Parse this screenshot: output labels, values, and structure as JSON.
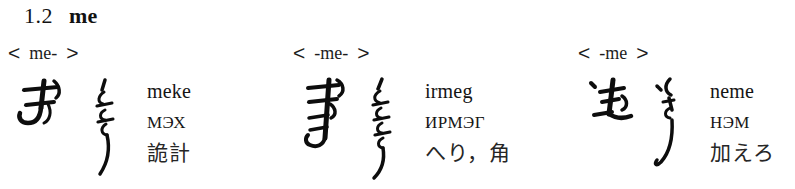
{
  "section": {
    "number": "1.2",
    "lemma": "me"
  },
  "bracket": {
    "open": "<",
    "close": ">"
  },
  "columns": [
    {
      "id": "initial",
      "position_form": "me-",
      "glyph_horizontal_name": "mongolian-script-meke-horizontal",
      "glyph_vertical_name": "mongolian-script-meke-vertical",
      "latin": "meke",
      "cyrillic": "мэх",
      "japanese": "詭計"
    },
    {
      "id": "medial",
      "position_form": "-me-",
      "glyph_horizontal_name": "mongolian-script-irmeg-horizontal",
      "glyph_vertical_name": "mongolian-script-irmeg-vertical",
      "latin": "irmeg",
      "cyrillic": "ирмэг",
      "japanese": "へり，角"
    },
    {
      "id": "final",
      "position_form": "-me",
      "glyph_horizontal_name": "mongolian-script-neme-horizontal",
      "glyph_vertical_name": "mongolian-script-neme-vertical",
      "latin": "neme",
      "cyrillic": "нэм",
      "japanese": "加えろ"
    }
  ],
  "colors": {
    "ink": "#161616",
    "page": "#ffffff"
  }
}
